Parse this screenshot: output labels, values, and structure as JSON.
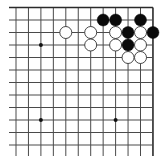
{
  "board": {
    "description": "Top-right corner region of a 19x19 Go board",
    "visible_columns": 12,
    "visible_rows": 12,
    "col_x0": 16,
    "col_step": 12.45,
    "row_y0": 7.5,
    "row_step": 12.5,
    "line_left": 9,
    "line_bottom": 156,
    "colors": {
      "background": "#ffffff",
      "grid": "#4a4a4a",
      "edge": "#2a2a2a",
      "black_stone": "#0a0a0a",
      "white_stone_fill": "#ffffff",
      "white_stone_stroke": "#333333",
      "star_point": "#111111"
    },
    "star_points": [
      {
        "col": 2,
        "row": 3
      },
      {
        "col": 2,
        "row": 9
      },
      {
        "col": 8,
        "row": 9
      }
    ],
    "stones": [
      {
        "color": "black",
        "col": 7,
        "row": 1
      },
      {
        "color": "black",
        "col": 8,
        "row": 1
      },
      {
        "color": "black",
        "col": 10,
        "row": 1
      },
      {
        "color": "white",
        "col": 4,
        "row": 2
      },
      {
        "color": "white",
        "col": 6,
        "row": 2
      },
      {
        "color": "white",
        "col": 8,
        "row": 2
      },
      {
        "color": "black",
        "col": 9,
        "row": 2
      },
      {
        "color": "white",
        "col": 10,
        "row": 2
      },
      {
        "color": "black",
        "col": 11,
        "row": 2
      },
      {
        "color": "white",
        "col": 6,
        "row": 3
      },
      {
        "color": "white",
        "col": 8,
        "row": 3
      },
      {
        "color": "black",
        "col": 9,
        "row": 3
      },
      {
        "color": "white",
        "col": 10,
        "row": 3
      },
      {
        "color": "white",
        "col": 9,
        "row": 4
      },
      {
        "color": "white",
        "col": 10,
        "row": 4
      }
    ],
    "stone_radius": 6
  }
}
